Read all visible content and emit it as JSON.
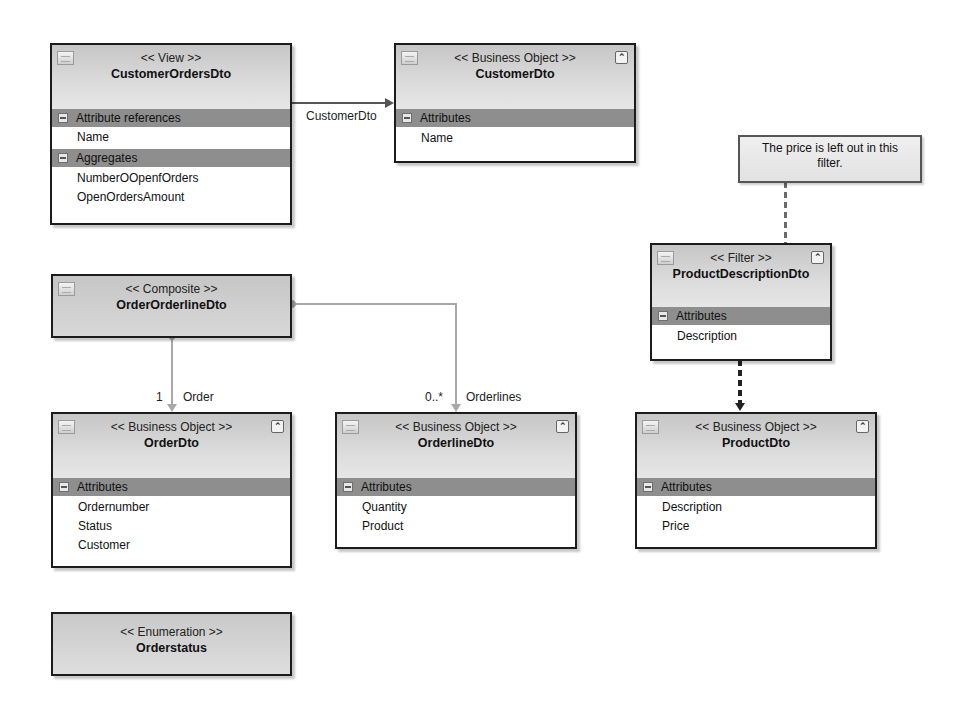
{
  "diagram": {
    "nodes": {
      "customerOrdersDto": {
        "stereotype": "<< View >>",
        "name": "CustomerOrdersDto",
        "icon": "view-icon",
        "sections": [
          {
            "title": "Attribute references",
            "items": [
              "Name"
            ]
          },
          {
            "title": "Aggregates",
            "items": [
              "NumberOOpenfOrders",
              "OpenOrdersAmount"
            ]
          }
        ]
      },
      "customerDto": {
        "stereotype": "<< Business Object >>",
        "name": "CustomerDto",
        "icon": "business-object-icon",
        "collapse_glyph": "⌃",
        "sections": [
          {
            "title": "Attributes",
            "items": [
              "Name"
            ]
          }
        ]
      },
      "productDescriptionDto": {
        "stereotype": "<< Filter >>",
        "name": "ProductDescriptionDto",
        "icon": "filter-icon",
        "collapse_glyph": "⌃",
        "sections": [
          {
            "title": "Attributes",
            "items": [
              "Description"
            ]
          }
        ]
      },
      "orderOrderlineDto": {
        "stereotype": "<< Composite >>",
        "name": "OrderOrderlineDto",
        "icon": "composite-icon"
      },
      "orderDto": {
        "stereotype": "<< Business Object >>",
        "name": "OrderDto",
        "icon": "business-object-icon",
        "collapse_glyph": "⌃",
        "sections": [
          {
            "title": "Attributes",
            "items": [
              "Ordernumber",
              "Status",
              "Customer"
            ]
          }
        ]
      },
      "orderlineDto": {
        "stereotype": "<< Business Object >>",
        "name": "OrderlineDto",
        "icon": "business-object-icon",
        "collapse_glyph": "⌃",
        "sections": [
          {
            "title": "Attributes",
            "items": [
              "Quantity",
              "Product"
            ]
          }
        ]
      },
      "productDto": {
        "stereotype": "<< Business Object >>",
        "name": "ProductDto",
        "icon": "business-object-icon",
        "collapse_glyph": "⌃",
        "sections": [
          {
            "title": "Attributes",
            "items": [
              "Description",
              "Price"
            ]
          }
        ]
      },
      "orderstatus": {
        "stereotype": "<< Enumeration >>",
        "name": "Orderstatus"
      }
    },
    "note": {
      "text": "The price is left out in this filter."
    },
    "connectors": {
      "customer_ref": {
        "label": "CustomerDto"
      },
      "order_assoc": {
        "multiplicity": "1",
        "role": "Order"
      },
      "orderlines_assoc": {
        "multiplicity": "0..*",
        "role": "Orderlines"
      }
    },
    "colors": {
      "border": "#1c1c1c",
      "section_header": "#8e8e8e",
      "header_gradient_top": "#c6c6c6",
      "connector_light": "#a8a8a8",
      "connector_dark": "#555555"
    }
  }
}
